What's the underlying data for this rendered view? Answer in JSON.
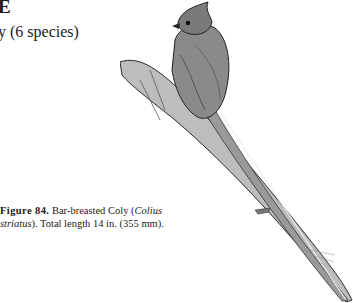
{
  "page": {
    "heading_fragment": "E",
    "subheading_fragment": "y (6 species)"
  },
  "figure": {
    "label": "Figure 84.",
    "caption_text_1": "Bar-breasted Coly (",
    "caption_italic_1": "Colius",
    "caption_italic_2": "striatus",
    "caption_text_2": "). Total length 14 in. (355 mm).",
    "illustration": "bar-breasted-coly-illustration"
  }
}
